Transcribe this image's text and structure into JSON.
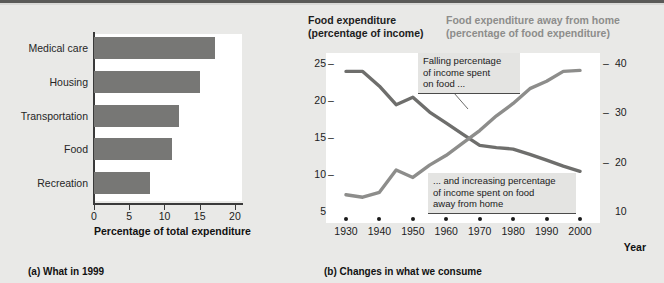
{
  "figure": {
    "background_color": "#e9e9e7",
    "bar_color": "#777775",
    "line_color_dark": "#6e6e6c",
    "line_color_gray": "#8d8d8b"
  },
  "panel_a": {
    "caption": "(a) What in 1999",
    "x_axis_title": "Percentage of total expenditure",
    "chart_data": {
      "type": "bar",
      "orientation": "horizontal",
      "title": "",
      "xlabel": "Percentage of total expenditure",
      "ylabel": "",
      "categories": [
        "Medical care",
        "Housing",
        "Transportation",
        "Food",
        "Recreation"
      ],
      "values": [
        17.2,
        15.0,
        12.1,
        11.0,
        8.0
      ],
      "xlim": [
        0,
        21
      ],
      "xticks": [
        0,
        5,
        10,
        15,
        20
      ],
      "xtick_labels": [
        "0",
        "5",
        "10",
        "15",
        "20"
      ],
      "grid": false,
      "legend": "none"
    }
  },
  "panel_b": {
    "caption": "(b) Changes in what we consume",
    "header_left_line1": "Food expenditure",
    "header_left_line2": "(percentage of income)",
    "header_right_line1": "Food expenditure away from home",
    "header_right_line2": "(percentage of food expenditure)",
    "x_axis_title": "Year",
    "callout_1": "Falling percentage of income spent on food ...",
    "callout_2": "... and increasing percentage of income spent on food away from home",
    "callout_1_lines": [
      "Falling percentage",
      "of income spent",
      "on food ..."
    ],
    "callout_2_lines": [
      "... and increasing percentage",
      "of income spent on food",
      "away from home"
    ],
    "chart_data": {
      "type": "line",
      "title": "",
      "xlabel": "Year",
      "x": [
        1930,
        1935,
        1940,
        1945,
        1950,
        1955,
        1960,
        1965,
        1970,
        1975,
        1980,
        1985,
        1990,
        1995,
        2000
      ],
      "xticks": [
        1930,
        1940,
        1950,
        1960,
        1970,
        1980,
        1990,
        2000
      ],
      "xtick_labels": [
        "1930",
        "1940",
        "1950",
        "1960",
        "1970",
        "1980",
        "1990",
        "2000"
      ],
      "grid": false,
      "legend": "none",
      "series": [
        {
          "name": "Food expenditure (percentage of income)",
          "axis": "left",
          "ylabel": "(percentage of income)",
          "ylim": [
            5,
            25
          ],
          "yticks": [
            5,
            10,
            15,
            20,
            25
          ],
          "ytick_labels": [
            "5",
            "10",
            "15",
            "20",
            "25"
          ],
          "color": "#6e6e6c",
          "values": [
            24.0,
            24.0,
            22.0,
            19.5,
            20.5,
            18.5,
            17.0,
            15.5,
            14.0,
            13.7,
            13.5,
            12.8,
            12.0,
            11.2,
            10.5
          ]
        },
        {
          "name": "Food expenditure away from home (percentage of food expenditure)",
          "axis": "right",
          "ylabel": "(percentage of food expenditure)",
          "ylim": [
            10,
            40
          ],
          "yticks": [
            10,
            20,
            30,
            40
          ],
          "ytick_labels": [
            "10",
            "20",
            "30",
            "40"
          ],
          "color": "#8d8d8b",
          "values": [
            13.5,
            13.0,
            14.0,
            18.5,
            17.0,
            19.5,
            21.5,
            24.0,
            26.5,
            29.5,
            32.0,
            35.0,
            36.5,
            38.5,
            38.7
          ]
        }
      ]
    }
  }
}
